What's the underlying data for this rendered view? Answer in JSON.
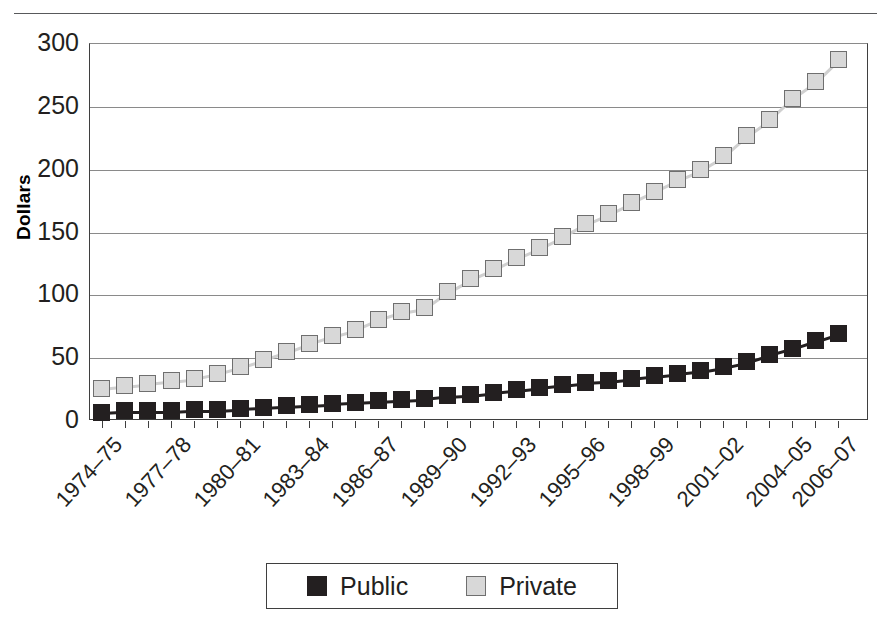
{
  "chart_data": {
    "type": "line",
    "title": "",
    "xlabel": "",
    "ylabel": "Dollars",
    "ylim": [
      0,
      300
    ],
    "yticks": [
      0,
      50,
      100,
      150,
      200,
      250,
      300
    ],
    "grid": true,
    "legend_position": "bottom",
    "x": [
      "1974-75",
      "1975-76",
      "1976-77",
      "1977-78",
      "1978-79",
      "1979-80",
      "1980-81",
      "1981-82",
      "1982-83",
      "1983-84",
      "1984-85",
      "1985-86",
      "1986-87",
      "1987-88",
      "1988-89",
      "1989-90",
      "1990-91",
      "1991-92",
      "1992-93",
      "1993-94",
      "1994-95",
      "1995-96",
      "1996-97",
      "1997-98",
      "1998-99",
      "1999-00",
      "2000-01",
      "2001-02",
      "2002-03",
      "2003-04",
      "2004-05",
      "2005-06",
      "2006-07"
    ],
    "xtick_labels": [
      "1974–75",
      "1977–78",
      "1980–81",
      "1983–84",
      "1986–87",
      "1989–90",
      "1992–93",
      "1995–96",
      "1998–99",
      "2001–02",
      "2004–05",
      "2006–07"
    ],
    "xtick_indices": [
      0,
      3,
      6,
      9,
      12,
      15,
      18,
      21,
      24,
      27,
      30,
      32
    ],
    "series": [
      {
        "name": "Public",
        "color": "#231f20",
        "marker": "filled-square",
        "values": [
          7,
          8,
          8,
          8,
          9,
          9,
          10,
          11,
          12,
          13,
          14,
          15,
          16,
          17,
          18,
          20,
          21,
          23,
          25,
          27,
          29,
          31,
          32,
          34,
          36,
          38,
          40,
          43,
          47,
          53,
          58,
          64,
          70
        ]
      },
      {
        "name": "Private",
        "color": "#d8d8d8",
        "marker": "open-square",
        "values": [
          26,
          28,
          30,
          32,
          34,
          38,
          43,
          49,
          55,
          62,
          68,
          73,
          81,
          87,
          90,
          103,
          113,
          121,
          130,
          138,
          147,
          157,
          165,
          174,
          183,
          192,
          200,
          211,
          227,
          240,
          257,
          270,
          288
        ]
      }
    ]
  },
  "legend": {
    "items": [
      {
        "label": "Public",
        "swatch": "filled-square"
      },
      {
        "label": "Private",
        "swatch": "open-square"
      }
    ]
  }
}
